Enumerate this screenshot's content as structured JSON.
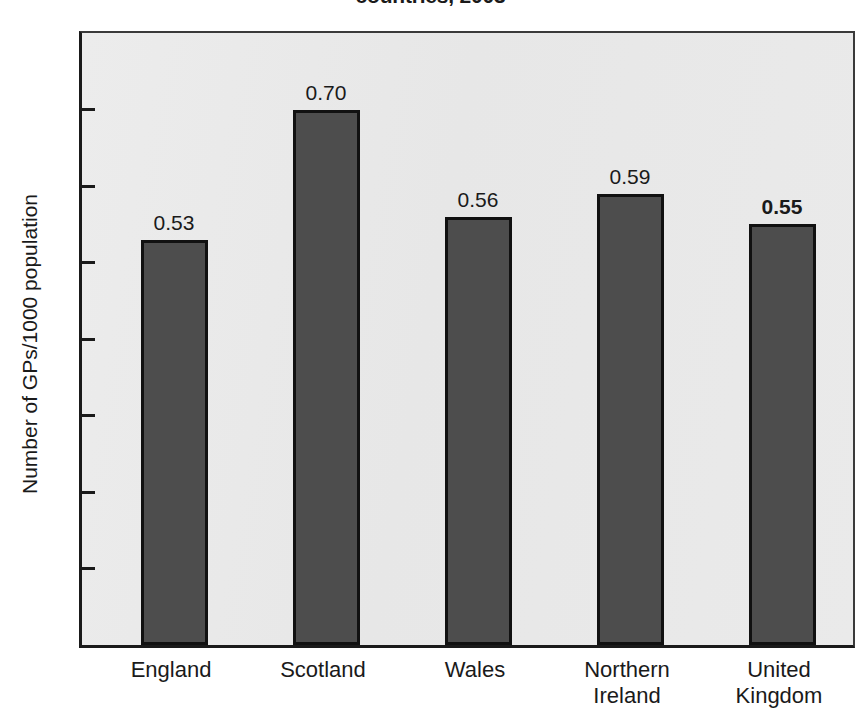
{
  "chart_data": {
    "type": "bar",
    "title": "countries, 2003",
    "xlabel": "",
    "ylabel": "Number of GPs/1000 population",
    "categories": [
      "England",
      "Scotland",
      "Wales",
      "Northern\nIreland",
      "United\nKingdom"
    ],
    "values": [
      0.53,
      0.7,
      0.56,
      0.59,
      0.55
    ],
    "value_labels": [
      "0.53",
      "0.70",
      "0.56",
      "0.59",
      "0.55"
    ],
    "value_label_bold": [
      false,
      false,
      false,
      false,
      true
    ],
    "ylim": [
      0,
      0.8
    ],
    "ytick_labels": [
      "0.8",
      "0.7",
      "0.6",
      "0.5",
      "0.4",
      "0.3",
      "0.2",
      "0.1",
      "0"
    ],
    "ytick_values": [
      0.8,
      0.7,
      0.6,
      0.5,
      0.4,
      0.3,
      0.2,
      0.1,
      0
    ],
    "grid": false,
    "legend": "none",
    "bar_color": "#4d4d4d",
    "bar_edge_color": "#111111",
    "plot_background": "#e9e9e9",
    "axis_color": "#1a1a1a"
  }
}
